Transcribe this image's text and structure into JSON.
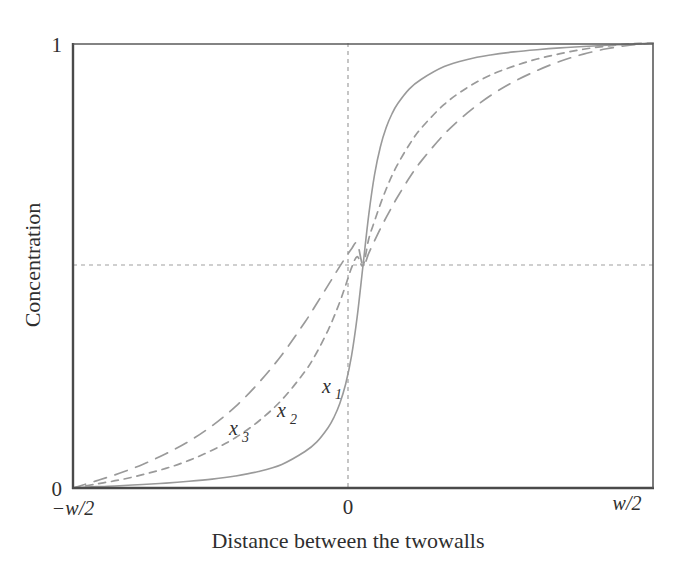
{
  "figure": {
    "background_color": "#ffffff",
    "axis_color": "#4a4a4a",
    "curve_color": "#9a9a9a",
    "guide_color": "#9e9e9e",
    "text_color": "#2f2f2f"
  },
  "chart_data": {
    "type": "line",
    "title": "",
    "subtitle": "",
    "xlabel": "Distance between the twowalls",
    "ylabel": "Concentration",
    "xlim": [
      -0.5,
      0.5
    ],
    "ylim": [
      0,
      1
    ],
    "grid": false,
    "legend_position": "inline-curve-labels",
    "x_tick_labels": [
      "-w/2",
      "0",
      "w/2"
    ],
    "x_tick_values": [
      -0.5,
      0,
      0.5
    ],
    "y_tick_labels": [
      "0",
      "1"
    ],
    "y_tick_values": [
      0,
      1
    ],
    "annotations": [
      {
        "text": "x",
        "subscript": "1",
        "x": -0.045,
        "y": 0.245,
        "style": "italic"
      },
      {
        "text": "x",
        "subscript": "2",
        "x": -0.128,
        "y": 0.19,
        "style": "italic"
      },
      {
        "text": "x",
        "subscript": "3",
        "x": -0.212,
        "y": 0.148,
        "style": "italic"
      }
    ],
    "guide_lines": [
      {
        "orientation": "vertical",
        "value": 0,
        "style": "dashed"
      },
      {
        "orientation": "horizontal",
        "value": 0.5,
        "style": "dashed"
      }
    ],
    "series": [
      {
        "name": "x1",
        "label": "x₁",
        "line_style": "solid",
        "color": "#9a9a9a",
        "description": "Steepest sigmoid; saturates fastest toward 0 and 1",
        "x": [
          -0.5,
          -0.46,
          -0.42,
          -0.38,
          -0.34,
          -0.3,
          -0.26,
          -0.22,
          -0.18,
          -0.14,
          -0.1,
          -0.08,
          -0.06,
          -0.05,
          -0.04,
          -0.03,
          -0.02,
          -0.01,
          0,
          0.01,
          0.02,
          0.03,
          0.04,
          0.05,
          0.06,
          0.08,
          0.1,
          0.14,
          0.18,
          0.22,
          0.26,
          0.3,
          0.34,
          0.38,
          0.42,
          0.46,
          0.5
        ],
        "y": [
          0.0,
          0.003,
          0.005,
          0.008,
          0.011,
          0.015,
          0.02,
          0.027,
          0.037,
          0.053,
          0.082,
          0.103,
          0.136,
          0.159,
          0.19,
          0.233,
          0.295,
          0.385,
          0.5,
          0.615,
          0.705,
          0.767,
          0.81,
          0.841,
          0.864,
          0.897,
          0.918,
          0.947,
          0.963,
          0.973,
          0.98,
          0.985,
          0.989,
          0.992,
          0.995,
          0.997,
          1.0
        ]
      },
      {
        "name": "x2",
        "label": "x₂",
        "line_style": "dashed-short",
        "color": "#9a9a9a",
        "description": "Intermediate sigmoid",
        "x": [
          -0.5,
          -0.46,
          -0.42,
          -0.38,
          -0.34,
          -0.3,
          -0.26,
          -0.22,
          -0.18,
          -0.14,
          -0.1,
          -0.08,
          -0.06,
          -0.05,
          -0.04,
          -0.03,
          -0.02,
          -0.01,
          0,
          0.01,
          0.02,
          0.03,
          0.04,
          0.05,
          0.06,
          0.08,
          0.1,
          0.14,
          0.18,
          0.22,
          0.26,
          0.3,
          0.34,
          0.38,
          0.42,
          0.46,
          0.5
        ],
        "y": [
          0.0,
          0.009,
          0.018,
          0.03,
          0.044,
          0.062,
          0.085,
          0.113,
          0.15,
          0.198,
          0.262,
          0.304,
          0.355,
          0.385,
          0.418,
          0.455,
          0.494,
          0.52,
          0.5,
          0.56,
          0.6,
          0.638,
          0.672,
          0.702,
          0.728,
          0.772,
          0.808,
          0.862,
          0.9,
          0.928,
          0.948,
          0.964,
          0.976,
          0.986,
          0.993,
          0.998,
          1.0
        ]
      },
      {
        "name": "x3",
        "label": "x₃",
        "line_style": "dashed-long",
        "color": "#9a9a9a",
        "description": "Shallowest sigmoid; most gradual transition",
        "x": [
          -0.5,
          -0.46,
          -0.42,
          -0.38,
          -0.34,
          -0.3,
          -0.26,
          -0.22,
          -0.18,
          -0.14,
          -0.1,
          -0.08,
          -0.06,
          -0.05,
          -0.04,
          -0.03,
          -0.02,
          -0.01,
          0,
          0.01,
          0.02,
          0.03,
          0.04,
          0.05,
          0.06,
          0.08,
          0.1,
          0.14,
          0.18,
          0.22,
          0.26,
          0.3,
          0.34,
          0.38,
          0.42,
          0.46,
          0.5
        ],
        "y": [
          0.0,
          0.016,
          0.033,
          0.053,
          0.077,
          0.105,
          0.14,
          0.183,
          0.236,
          0.299,
          0.373,
          0.414,
          0.456,
          0.477,
          0.498,
          0.518,
          0.537,
          0.55,
          0.5,
          0.528,
          0.556,
          0.583,
          0.608,
          0.632,
          0.655,
          0.697,
          0.734,
          0.795,
          0.843,
          0.882,
          0.913,
          0.938,
          0.959,
          0.975,
          0.987,
          0.995,
          1.0
        ]
      }
    ]
  },
  "axis": {
    "y_top_label": "1",
    "y_bottom_label": "0",
    "x_left_label_sign": "−",
    "x_left_label_var": "w",
    "x_left_label_rest": "/2",
    "x_left_label": "−w/2",
    "x_center_label": "0",
    "x_right_label_var": "w",
    "x_right_label_rest": "/2",
    "x_right_label": "w/2",
    "x_title": "Distance between the twowalls",
    "y_title": "Concentration"
  },
  "curve_labels": {
    "x1_base": "x",
    "x1_sub": "1",
    "x2_base": "x",
    "x2_sub": "2",
    "x3_base": "x",
    "x3_sub": "3"
  }
}
